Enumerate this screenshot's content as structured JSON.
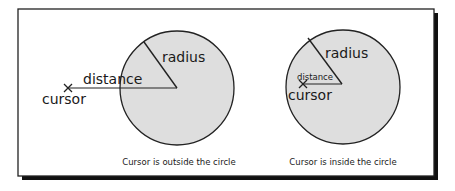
{
  "figure": {
    "frame": {
      "x": 18,
      "y": 9,
      "width": 416,
      "height": 167,
      "border_color": "#222222",
      "shadow_color": "#111111",
      "shadow_offset": 4
    },
    "circle_fill": "#dedede",
    "stroke_color": "#222222",
    "panels": [
      {
        "id": "outside",
        "caption": "Cursor is outside the circle",
        "caption_pos": [
          179,
          165
        ],
        "circle": {
          "cx": 177,
          "cy": 88,
          "r": 57
        },
        "radius_line": {
          "x1": 177,
          "y1": 88,
          "x2": 144,
          "y2": 42
        },
        "radius_label": "radius",
        "radius_label_pos": [
          162,
          62
        ],
        "cursor_marker": {
          "x": 68,
          "y": 88
        },
        "cursor_label": "cursor",
        "cursor_label_pos": [
          42,
          104
        ],
        "distance_line": {
          "x1": 68,
          "y1": 88,
          "x2": 177,
          "y2": 88
        },
        "distance_label": "distance",
        "distance_label_pos": [
          83,
          84
        ],
        "distance_label_size": "big"
      },
      {
        "id": "inside",
        "caption": "Cursor is inside the circle",
        "caption_pos": [
          343,
          165
        ],
        "circle": {
          "cx": 343,
          "cy": 87,
          "r": 57
        },
        "radius_line": {
          "x1": 342,
          "y1": 84,
          "x2": 308,
          "y2": 38
        },
        "radius_label": "radius",
        "radius_label_pos": [
          325,
          58
        ],
        "cursor_marker": {
          "x": 303,
          "y": 84
        },
        "cursor_label": "cursor",
        "cursor_label_pos": [
          288,
          100
        ],
        "distance_line": {
          "x1": 303,
          "y1": 84,
          "x2": 342,
          "y2": 84
        },
        "distance_label": "distance",
        "distance_label_pos": [
          297,
          80
        ],
        "distance_label_size": "small"
      }
    ]
  }
}
